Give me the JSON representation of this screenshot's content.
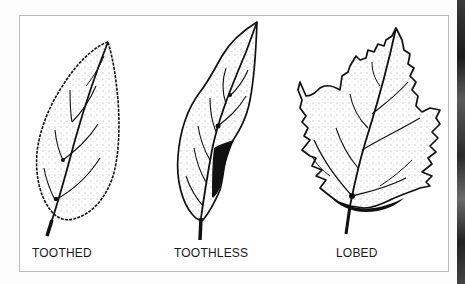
{
  "figure": {
    "leaves": [
      {
        "id": "toothed",
        "label": "TOOTHED",
        "icon": "toothed-leaf-illustration"
      },
      {
        "id": "toothless",
        "label": "TOOTHLESS",
        "icon": "toothless-leaf-illustration"
      },
      {
        "id": "lobed",
        "label": "LOBED",
        "icon": "lobed-leaf-illustration"
      }
    ]
  },
  "colors": {
    "ink": "#111111",
    "frame": "#b9b9b9",
    "paper": "#ffffff"
  }
}
